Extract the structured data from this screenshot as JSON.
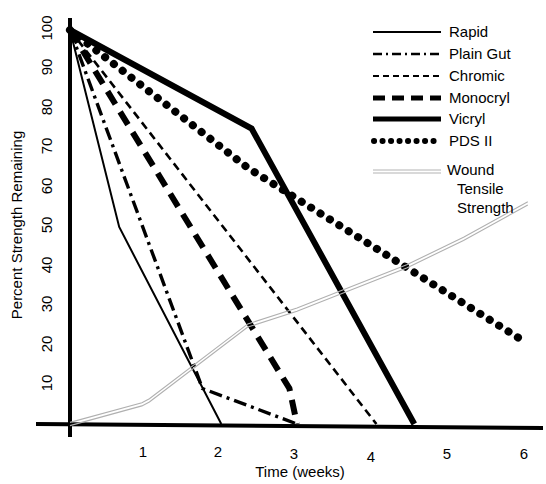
{
  "chart_data": {
    "type": "line",
    "title": "",
    "xlabel": "Time (weeks)",
    "ylabel": "Percent Strength Remaining",
    "xlim": [
      0,
      6.3
    ],
    "ylim": [
      0,
      103
    ],
    "xticks": [
      1,
      2,
      3,
      4,
      5,
      6
    ],
    "yticks": [
      10,
      20,
      30,
      40,
      50,
      60,
      70,
      80,
      90,
      100
    ],
    "grid": false,
    "legend_position": "top-right",
    "series": [
      {
        "name": "Rapid",
        "style": "solid-thin",
        "color": "#000000",
        "points": [
          [
            0,
            100
          ],
          [
            0.65,
            50
          ],
          [
            2.0,
            0
          ]
        ]
      },
      {
        "name": "Plain Gut",
        "style": "dash-dot",
        "color": "#000000",
        "points": [
          [
            0,
            100
          ],
          [
            1.75,
            9
          ],
          [
            3.0,
            0
          ]
        ]
      },
      {
        "name": "Chromic",
        "style": "fine-dash",
        "color": "#000000",
        "points": [
          [
            0,
            100
          ],
          [
            4.05,
            0
          ]
        ]
      },
      {
        "name": "Monocryl",
        "style": "heavy-dash",
        "color": "#000000",
        "points": [
          [
            0,
            100
          ],
          [
            2.9,
            9
          ],
          [
            3.0,
            0
          ]
        ]
      },
      {
        "name": "Vicryl",
        "style": "solid-thick",
        "color": "#000000",
        "points": [
          [
            0,
            100
          ],
          [
            2.4,
            75
          ],
          [
            4.55,
            0
          ]
        ]
      },
      {
        "name": "PDS II",
        "style": "dotted",
        "color": "#000000",
        "points": [
          [
            0,
            100
          ],
          [
            2.35,
            65
          ],
          [
            6.0,
            21
          ]
        ]
      },
      {
        "name": "Wound Tensile Strength",
        "style": "double-thin-grey",
        "color": "#b0b0b0",
        "points": [
          [
            0,
            0
          ],
          [
            0.95,
            5
          ],
          [
            1.05,
            6
          ],
          [
            2.35,
            25
          ],
          [
            3.0,
            29
          ],
          [
            4.45,
            40
          ],
          [
            5.2,
            47
          ],
          [
            6.05,
            56
          ]
        ]
      }
    ]
  },
  "axes": {
    "y_title": "Percent Strength Remaining",
    "x_title": "Time (weeks)",
    "y_tick_labels": [
      "100",
      "90",
      "80",
      "70",
      "60",
      "50",
      "40",
      "30",
      "20",
      "10"
    ],
    "x_tick_labels": [
      "1",
      "2",
      "3",
      "4",
      "5",
      "6"
    ]
  },
  "legend": {
    "entries": [
      {
        "label": "Rapid",
        "style": "solid-thin"
      },
      {
        "label": "Plain Gut",
        "style": "dash-dot"
      },
      {
        "label": "Chromic",
        "style": "fine-dash"
      },
      {
        "label": "Monocryl",
        "style": "heavy-dash"
      },
      {
        "label": "Vicryl",
        "style": "solid-thick"
      },
      {
        "label": "PDS II",
        "style": "dotted"
      }
    ],
    "wound_entry": {
      "line1": "Wound",
      "line2": "Tensile",
      "line3": "Strength",
      "style": "double-thin-grey"
    }
  },
  "colors": {
    "ink": "#000000",
    "wound": "#b3b3b3",
    "background": "#ffffff"
  }
}
